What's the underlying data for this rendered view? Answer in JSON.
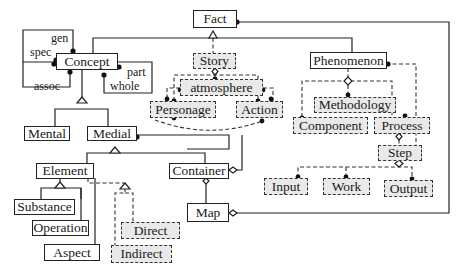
{
  "diagram": {
    "nodes": {
      "fact": "Fact",
      "concept": "Concept",
      "story": "Story",
      "phenomenon": "Phenomenon",
      "atmosphere": "atmosphere",
      "personage": "Personage",
      "action": "Action",
      "methodology": "Methodology",
      "component": "Component",
      "process": "Process",
      "step": "Step",
      "input": "Input",
      "work": "Work",
      "output": "Output",
      "mental": "Mental",
      "medial": "Medial",
      "element": "Element",
      "container": "Container",
      "substance": "Substance",
      "operation": "Operation",
      "aspect": "Aspect",
      "direct": "Direct",
      "indirect": "Indirect",
      "map": "Map"
    },
    "role_labels": {
      "gen": "gen",
      "spec": "spec",
      "assoc": "assoc",
      "part": "part",
      "whole": "whole"
    },
    "colors": {
      "line": "#222222",
      "dashed_fill": "#e9e9e9",
      "solid_fill": "#ffffff"
    }
  }
}
